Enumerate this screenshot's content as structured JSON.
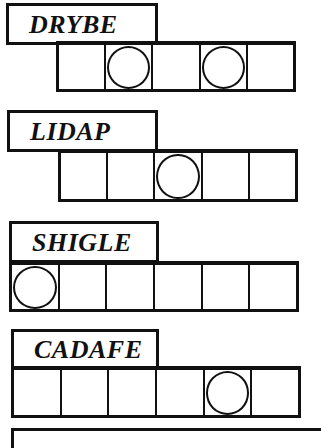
{
  "puzzles": [
    {
      "scrambled": "DRYBE",
      "cells": 5,
      "circled": [
        2,
        4
      ]
    },
    {
      "scrambled": "LIDAP",
      "cells": 5,
      "circled": [
        3
      ]
    },
    {
      "scrambled": "SHIGLE",
      "cells": 6,
      "circled": [
        1
      ]
    },
    {
      "scrambled": "CADAFE",
      "cells": 6,
      "circled": [
        5
      ]
    }
  ],
  "colors": {
    "ink": "#111111",
    "paper": "#ffffff"
  }
}
